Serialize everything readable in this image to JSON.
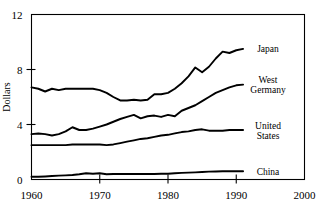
{
  "chart_data": {
    "type": "line",
    "title": "",
    "xlabel": "",
    "ylabel": "Dollars",
    "xlim": [
      1960,
      2000
    ],
    "ylim": [
      0,
      12
    ],
    "xticks": [
      1960,
      1970,
      1980,
      1990,
      2000
    ],
    "yticks": [
      0,
      4,
      8,
      12
    ],
    "grid": false,
    "legend_position": "right-inline-labels",
    "x": [
      1960,
      1961,
      1962,
      1963,
      1964,
      1965,
      1966,
      1967,
      1968,
      1969,
      1970,
      1971,
      1972,
      1973,
      1974,
      1975,
      1976,
      1977,
      1978,
      1979,
      1980,
      1981,
      1982,
      1983,
      1984,
      1985,
      1986,
      1987,
      1988,
      1989,
      1990,
      1991
    ],
    "series": [
      {
        "name": "Japan",
        "label": "Japan",
        "label_lines": [
          "Japan"
        ],
        "values": [
          6.7,
          6.6,
          6.4,
          6.6,
          6.5,
          6.6,
          6.6,
          6.6,
          6.6,
          6.6,
          6.5,
          6.3,
          6.0,
          5.75,
          5.75,
          5.8,
          5.75,
          5.8,
          6.2,
          6.2,
          6.3,
          6.6,
          7.0,
          7.5,
          8.15,
          7.8,
          8.2,
          8.8,
          9.3,
          9.2,
          9.4,
          9.5
        ]
      },
      {
        "name": "West Germany",
        "label": "West Germany",
        "label_lines": [
          "West",
          "Germany"
        ],
        "values": [
          3.3,
          3.35,
          3.3,
          3.2,
          3.3,
          3.5,
          3.8,
          3.6,
          3.6,
          3.7,
          3.85,
          4.0,
          4.2,
          4.4,
          4.55,
          4.7,
          4.45,
          4.6,
          4.65,
          4.55,
          4.7,
          4.6,
          5.0,
          5.2,
          5.4,
          5.7,
          6.0,
          6.3,
          6.5,
          6.7,
          6.85,
          6.9
        ]
      },
      {
        "name": "United States",
        "label": "United States",
        "label_lines": [
          "United",
          "States"
        ],
        "values": [
          2.5,
          2.5,
          2.5,
          2.5,
          2.5,
          2.5,
          2.55,
          2.55,
          2.55,
          2.55,
          2.55,
          2.5,
          2.55,
          2.65,
          2.75,
          2.85,
          2.95,
          3.0,
          3.1,
          3.2,
          3.25,
          3.35,
          3.45,
          3.5,
          3.6,
          3.65,
          3.55,
          3.55,
          3.55,
          3.6,
          3.6,
          3.6
        ]
      },
      {
        "name": "China",
        "label": "China",
        "label_lines": [
          "China"
        ],
        "values": [
          0.2,
          0.2,
          0.22,
          0.25,
          0.28,
          0.3,
          0.33,
          0.38,
          0.45,
          0.42,
          0.45,
          0.38,
          0.4,
          0.4,
          0.4,
          0.4,
          0.4,
          0.4,
          0.4,
          0.42,
          0.42,
          0.45,
          0.48,
          0.5,
          0.52,
          0.55,
          0.57,
          0.58,
          0.6,
          0.6,
          0.6,
          0.6
        ]
      }
    ]
  }
}
